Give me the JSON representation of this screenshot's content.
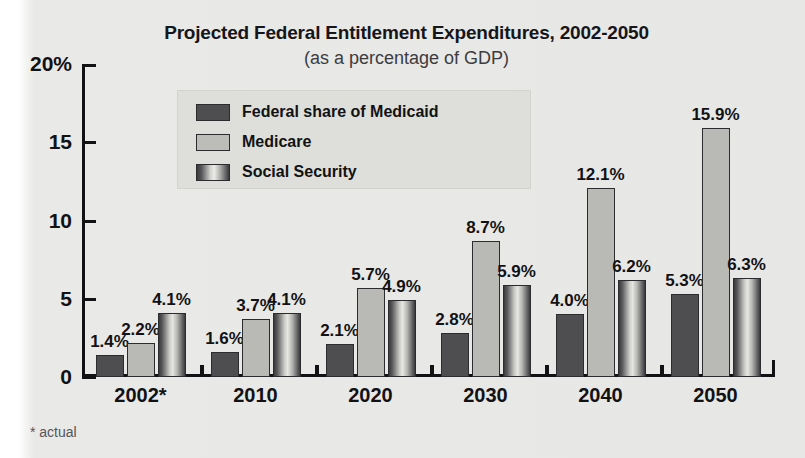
{
  "chart_data": {
    "type": "bar",
    "title": "Projected Federal Entitlement Expenditures, 2002-2050",
    "subtitle": "(as a percentage of GDP)",
    "xlabel": "",
    "ylabel": "",
    "ylim": [
      0,
      20
    ],
    "yticks": [
      "20%",
      "15",
      "10",
      "5",
      "0"
    ],
    "ytick_values": [
      20,
      15,
      10,
      5,
      0
    ],
    "grid": false,
    "legend_position": "inside-top-center",
    "categories": [
      "2002*",
      "2010",
      "2020",
      "2030",
      "2040",
      "2050"
    ],
    "series": [
      {
        "name": "Federal share of Medicaid",
        "color": "#4e4e50",
        "values": [
          1.4,
          1.6,
          2.1,
          2.8,
          4.0,
          5.3
        ],
        "labels": [
          "1.4%",
          "1.6%",
          "2.1%",
          "2.8%",
          "4.0%",
          "5.3%"
        ]
      },
      {
        "name": "Medicare",
        "color": "#b9b9b6",
        "values": [
          2.2,
          3.7,
          5.7,
          8.7,
          12.1,
          15.9
        ],
        "labels": [
          "2.2%",
          "3.7%",
          "5.7%",
          "8.7%",
          "12.1%",
          "15.9%"
        ]
      },
      {
        "name": "Social Security",
        "color": "#9a9a98",
        "values": [
          4.1,
          4.1,
          4.9,
          5.9,
          6.2,
          6.3
        ],
        "labels": [
          "4.1%",
          "4.1%",
          "4.9%",
          "5.9%",
          "6.2%",
          "6.3%"
        ]
      }
    ],
    "footnote": "* actual"
  },
  "legend": {
    "items": [
      {
        "label": "Federal share of Medicaid"
      },
      {
        "label": "Medicare"
      },
      {
        "label": "Social Security"
      }
    ]
  }
}
